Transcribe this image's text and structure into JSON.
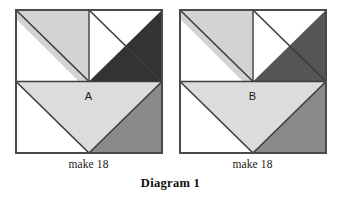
{
  "figure": {
    "caption": "Diagram 1",
    "panels": [
      {
        "letter": "A",
        "make_label": "make 18",
        "name": "tile-a"
      },
      {
        "letter": "B",
        "make_label": "make 18",
        "name": "tile-b"
      }
    ]
  },
  "colors": {
    "background": "#ffffff",
    "outline": "#4a4a4a",
    "inner_line": "#3d3d3d",
    "light_gray": "#d3d3d3",
    "pale_gray": "#dcdcdc",
    "medium_gray": "#8a8a8a",
    "dark_gray": "#333333",
    "white": "#ffffff",
    "text": "#1a1a1a"
  },
  "geometry": {
    "tile_width": 146,
    "tile_height": 143,
    "half_width": 73,
    "half_height": 71.5,
    "note": "Square split into top half (two square quadrants each cut by a top-left to bottom-right diagonal) and bottom half (downward-pointing triangle flanked by two corner triangles)."
  }
}
